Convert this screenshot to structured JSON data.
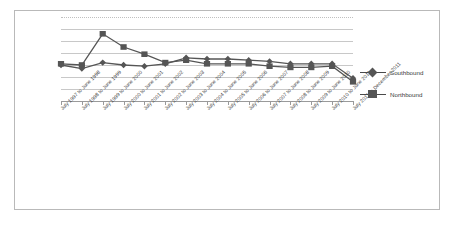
{
  "chart_data": {
    "type": "line",
    "title": "",
    "xlabel": "",
    "ylabel": "",
    "grid": true,
    "legend_position": "right",
    "ylim": [
      0,
      7
    ],
    "gridline_values": [
      7,
      6,
      5,
      4,
      3,
      2,
      1
    ],
    "categories": [
      "July 1997 to June 1998",
      "July 1998 to June 1999",
      "July 1999 to June 2000",
      "July 2000 to June 2001",
      "July 2001 to June 2002",
      "July 2002 to June 2003",
      "July 2003 to June 2004",
      "July 2004 to June 2005",
      "July 2005 to June 2006",
      "July 2006 to June 2007",
      "July 2007 to June 2008",
      "July 2008 to June 2009",
      "July 2009 to June 2010",
      "July 2010 to June 2011",
      "July 2011 to December 2011"
    ],
    "series": [
      {
        "name": "Southbound",
        "marker": "diamond",
        "color": "#555555",
        "values": [
          3.0,
          2.7,
          3.2,
          3.0,
          2.9,
          3.1,
          3.6,
          3.5,
          3.5,
          3.4,
          3.3,
          3.1,
          3.1,
          3.1,
          1.9
        ]
      },
      {
        "name": "Northbound",
        "marker": "square",
        "color": "#555555",
        "values": [
          3.1,
          3.0,
          5.6,
          4.5,
          3.9,
          3.2,
          3.4,
          3.1,
          3.1,
          3.1,
          2.9,
          2.8,
          2.8,
          2.9,
          1.6
        ]
      }
    ]
  },
  "legend": {
    "items": [
      {
        "label": "Southbound",
        "marker": "diamond"
      },
      {
        "label": "Northbound",
        "marker": "square"
      }
    ]
  }
}
